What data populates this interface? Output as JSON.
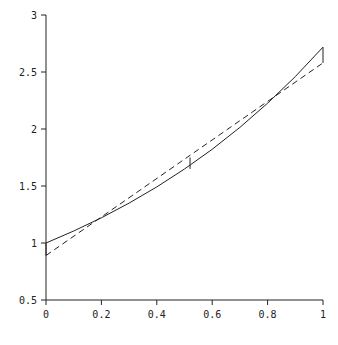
{
  "chart_data": {
    "type": "line",
    "title": "",
    "xlabel": "",
    "ylabel": "",
    "xlim": [
      0,
      1
    ],
    "ylim": [
      0.5,
      3
    ],
    "grid": false,
    "legend": null,
    "x_ticks": [
      "0",
      "0.2",
      "0.4",
      "0.6",
      "0.8",
      "1"
    ],
    "y_ticks": [
      "0.5",
      "1",
      "1.5",
      "2",
      "2.5",
      "3"
    ],
    "series": [
      {
        "name": "curve (solid)",
        "style": "solid",
        "x": [
          0,
          0.1,
          0.2,
          0.3,
          0.4,
          0.5,
          0.6,
          0.7,
          0.8,
          0.9,
          1.0
        ],
        "y": [
          1.0,
          1.105,
          1.221,
          1.35,
          1.492,
          1.649,
          1.822,
          2.014,
          2.226,
          2.46,
          2.718
        ]
      },
      {
        "name": "linear approximation (dashed)",
        "style": "dashed",
        "x": [
          0,
          1
        ],
        "y": [
          0.89,
          2.58
        ]
      }
    ],
    "annotations": [
      {
        "type": "error-bar",
        "x": 0,
        "y_from": 0.89,
        "y_to": 1.0
      },
      {
        "type": "error-bar",
        "x": 0.52,
        "y_from": 1.65,
        "y_to": 1.75
      },
      {
        "type": "error-bar",
        "x": 1,
        "y_from": 2.58,
        "y_to": 2.718
      }
    ]
  },
  "plot": {
    "colors": {
      "line": "#222222",
      "axis": "#222222",
      "background": "#ffffff"
    }
  }
}
